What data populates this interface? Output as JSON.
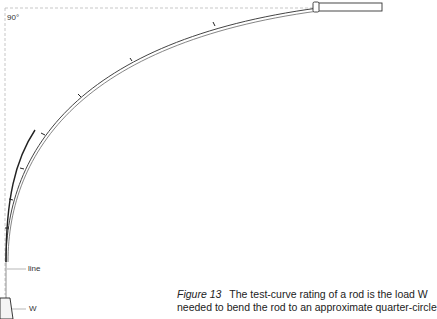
{
  "diagram": {
    "angle_label": "90°",
    "line_label": "line",
    "weight_label": "W",
    "colors": {
      "rod_outline": "#333333",
      "guide_dashed": "#aaaaaa",
      "text": "#222222"
    }
  },
  "caption": {
    "figure_label": "Figure 13",
    "line1": "The test-curve rating of a rod is the load W",
    "line2": "needed to bend the rod to an approximate quarter-circle"
  }
}
